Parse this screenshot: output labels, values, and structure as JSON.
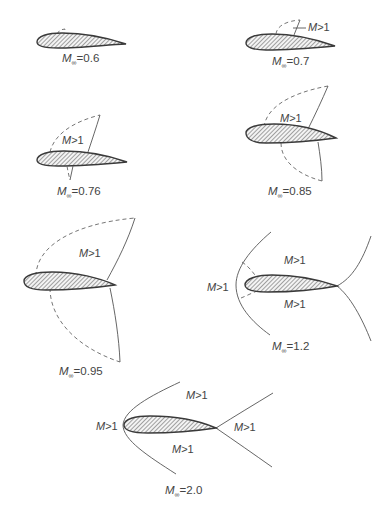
{
  "figure": {
    "panels": [
      {
        "id": "m0_6",
        "mach_label": {
          "symbol": "M",
          "subscript": "∞",
          "value": "=0.6"
        },
        "regions": []
      },
      {
        "id": "m0_7",
        "mach_label": {
          "symbol": "M",
          "subscript": "∞",
          "value": "=0.7"
        },
        "regions": [
          {
            "symbol": "M",
            "text": ">1"
          }
        ]
      },
      {
        "id": "m0_76",
        "mach_label": {
          "symbol": "M",
          "subscript": "∞",
          "value": "=0.76"
        },
        "regions": [
          {
            "symbol": "M",
            "text": ">1"
          }
        ]
      },
      {
        "id": "m0_85",
        "mach_label": {
          "symbol": "M",
          "subscript": "∞",
          "value": "=0.85"
        },
        "regions": [
          {
            "symbol": "M",
            "text": ">1"
          }
        ]
      },
      {
        "id": "m0_95",
        "mach_label": {
          "symbol": "M",
          "subscript": "∞",
          "value": "=0.95"
        },
        "regions": [
          {
            "symbol": "M",
            "text": ">1"
          }
        ]
      },
      {
        "id": "m1_2",
        "mach_label": {
          "symbol": "M",
          "subscript": "∞",
          "value": "=1.2"
        },
        "regions": [
          {
            "symbol": "M",
            "text": ">1"
          },
          {
            "symbol": "M",
            "text": ">1"
          },
          {
            "symbol": "M",
            "text": ">1"
          }
        ]
      },
      {
        "id": "m2_0",
        "mach_label": {
          "symbol": "M",
          "subscript": "∞",
          "value": "=2.0"
        },
        "regions": [
          {
            "symbol": "M",
            "text": ">1"
          },
          {
            "symbol": "M",
            "text": ">1"
          },
          {
            "symbol": "M",
            "text": ">1"
          },
          {
            "symbol": "M",
            "text": ">1"
          }
        ]
      }
    ],
    "legend": {
      "solid_line": "shock wave",
      "dashed_line": "sonic line (M=1)",
      "hatched_shape": "airfoil section"
    },
    "colors": {
      "airfoil_outline": "#3a3a3a",
      "shock": "#555555",
      "sonic": "#666666",
      "text": "#444444",
      "background": "#ffffff"
    }
  }
}
